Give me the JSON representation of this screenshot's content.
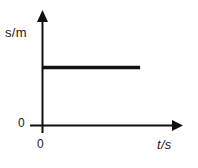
{
  "figure": {
    "background_color": "#ffffff",
    "stroke_color": "#111111",
    "width": 198,
    "height": 168
  },
  "labels": {
    "y_axis": "s/m",
    "x_axis": "t/s",
    "origin_y": "0",
    "origin_x": "0"
  },
  "chart_data": {
    "type": "line",
    "title": "",
    "xlabel": "t/s",
    "ylabel": "s/m",
    "grid": false,
    "legend": null,
    "axis_arrows": true,
    "xlim": [
      0,
      10
    ],
    "ylim": [
      0,
      10
    ],
    "xticks": [
      0
    ],
    "xticklabels": [
      "0"
    ],
    "yticks": [
      0
    ],
    "yticklabels": [
      "0"
    ],
    "series": [
      {
        "name": "displacement",
        "line_width": 3.5,
        "color": "#111111",
        "x": [
          0,
          8.1
        ],
        "y": [
          5.6,
          5.6
        ],
        "description": "constant displacement: object at rest"
      }
    ]
  }
}
